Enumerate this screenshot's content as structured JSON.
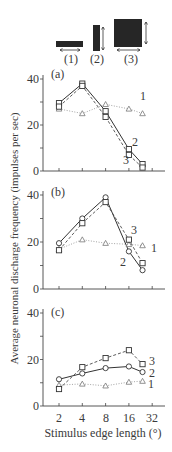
{
  "figure": {
    "stimuli": [
      {
        "label": "(1)",
        "shape": "horizontal-bar"
      },
      {
        "label": "(2)",
        "shape": "vertical-bar"
      },
      {
        "label": "(3)",
        "shape": "square"
      }
    ],
    "y_axis_label": "Average neuronal discharge frequency (impulses per sec)",
    "x_axis_label": "Stimulus edge length (°)",
    "x_tick_labels": [
      "2",
      "4",
      "8",
      "16",
      "32"
    ],
    "y_tick_labels": [
      "40",
      "20",
      "0"
    ],
    "colors": {
      "solid": "#333333",
      "dashed": "#4a4a4a",
      "dotted": "#9a9a9a",
      "fill": "#262626"
    }
  },
  "chart_data": [
    {
      "type": "line",
      "panel_label": "(a)",
      "xscale": "log2",
      "x": [
        2,
        4,
        8,
        16,
        24
      ],
      "xticks": [
        2,
        4,
        8,
        16,
        32
      ],
      "ylim": [
        0,
        40
      ],
      "yticks": [
        0,
        20,
        40
      ],
      "xlabel": "Stimulus edge length (°)",
      "ylabel": "Average neuronal discharge frequency (impulses per sec)",
      "series": [
        {
          "name": "1",
          "marker": "triangle",
          "line": "dotted",
          "values": [
            27,
            25,
            29,
            27,
            25
          ]
        },
        {
          "name": "2",
          "marker": "square",
          "line": "solid",
          "values": [
            29.5,
            38,
            26,
            9.5,
            3
          ]
        },
        {
          "name": "3",
          "marker": "square",
          "line": "dashed",
          "values": [
            28,
            37,
            23.5,
            7,
            1.5
          ]
        }
      ]
    },
    {
      "type": "line",
      "panel_label": "(b)",
      "xscale": "log2",
      "x": [
        2,
        4,
        8,
        16,
        24
      ],
      "xticks": [
        2,
        4,
        8,
        16,
        32
      ],
      "ylim": [
        0,
        40
      ],
      "yticks": [
        0,
        20,
        40
      ],
      "xlabel": "Stimulus edge length (°)",
      "ylabel": "Average neuronal discharge frequency (impulses per sec)",
      "series": [
        {
          "name": "1",
          "marker": "triangle",
          "line": "dotted",
          "values": [
            17,
            21,
            19.5,
            19,
            18.5
          ]
        },
        {
          "name": "2",
          "marker": "circle",
          "line": "solid",
          "values": [
            19.5,
            30,
            39,
            16,
            8
          ]
        },
        {
          "name": "3",
          "marker": "square",
          "line": "dashed",
          "values": [
            16.5,
            28,
            37,
            21,
            11
          ]
        }
      ]
    },
    {
      "type": "line",
      "panel_label": "(c)",
      "xscale": "log2",
      "x": [
        2,
        4,
        8,
        16,
        24
      ],
      "xticks": [
        2,
        4,
        8,
        16,
        32
      ],
      "ylim": [
        0,
        40
      ],
      "yticks": [
        0,
        20,
        40
      ],
      "xlabel": "Stimulus edge length (°)",
      "ylabel": "Average neuronal discharge frequency (impulses per sec)",
      "series": [
        {
          "name": "1",
          "marker": "triangle",
          "line": "dotted",
          "values": [
            9,
            9.5,
            8.7,
            10.3,
            10.7
          ]
        },
        {
          "name": "2",
          "marker": "circle",
          "line": "solid",
          "values": [
            11.5,
            14,
            16.3,
            17,
            14.6
          ]
        },
        {
          "name": "3",
          "marker": "square",
          "line": "dashed",
          "values": [
            7.3,
            16.7,
            20.6,
            24,
            18
          ]
        }
      ]
    }
  ]
}
